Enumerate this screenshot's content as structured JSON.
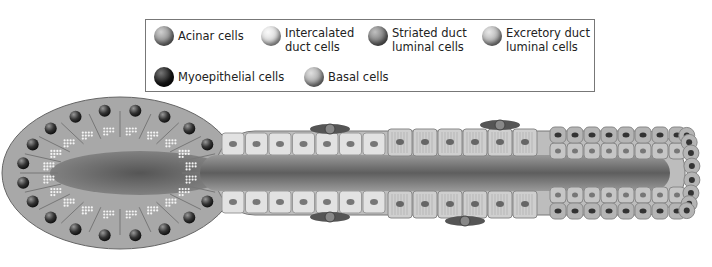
{
  "legend": {
    "items": [
      {
        "label": "Acinar cells",
        "color": "#8c8c8c"
      },
      {
        "label": "Intercalated\nduct cells",
        "color": "#d6d6d6"
      },
      {
        "label": "Striated duct\nluminal cells",
        "color": "#7a7a7a"
      },
      {
        "label": "Excretory duct\nluminal cells",
        "color": "#b0b0b0"
      },
      {
        "label": "Myoepithelial cells",
        "color": "#1a1a1a"
      },
      {
        "label": "Basal cells",
        "color": "#a6a6a6"
      }
    ]
  },
  "diagram": {
    "regions": [
      "acinus",
      "intercalated duct",
      "striated duct",
      "excretory duct"
    ]
  }
}
